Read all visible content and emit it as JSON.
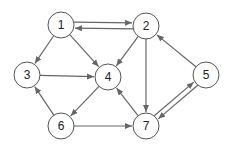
{
  "diagram": {
    "type": "directed-graph",
    "colors": {
      "node_stroke": "#555555",
      "node_fill": "#ffffff",
      "edge": "#666666",
      "label": "#222222"
    },
    "node_radius": 13,
    "nodes": [
      {
        "id": "1",
        "label": "1",
        "x": 61,
        "y": 25
      },
      {
        "id": "2",
        "label": "2",
        "x": 146,
        "y": 26
      },
      {
        "id": "3",
        "label": "3",
        "x": 27,
        "y": 75
      },
      {
        "id": "4",
        "label": "4",
        "x": 108,
        "y": 77
      },
      {
        "id": "5",
        "label": "5",
        "x": 206,
        "y": 75
      },
      {
        "id": "6",
        "label": "6",
        "x": 61,
        "y": 126
      },
      {
        "id": "7",
        "label": "7",
        "x": 146,
        "y": 126
      }
    ],
    "edges": [
      {
        "from": "2",
        "to": "1",
        "offset": -3
      },
      {
        "from": "1",
        "to": "2",
        "offset": -3
      },
      {
        "from": "1",
        "to": "3",
        "offset": 0
      },
      {
        "from": "1",
        "to": "4",
        "offset": 0
      },
      {
        "from": "2",
        "to": "4",
        "offset": 0
      },
      {
        "from": "2",
        "to": "7",
        "offset": 0
      },
      {
        "from": "3",
        "to": "4",
        "offset": 0
      },
      {
        "from": "4",
        "to": "6",
        "offset": 0
      },
      {
        "from": "6",
        "to": "3",
        "offset": 0
      },
      {
        "from": "6",
        "to": "7",
        "offset": 0
      },
      {
        "from": "7",
        "to": "4",
        "offset": 0
      },
      {
        "from": "5",
        "to": "2",
        "offset": 0
      },
      {
        "from": "5",
        "to": "7",
        "offset": -2.5
      },
      {
        "from": "7",
        "to": "5",
        "offset": -2.5
      }
    ]
  }
}
